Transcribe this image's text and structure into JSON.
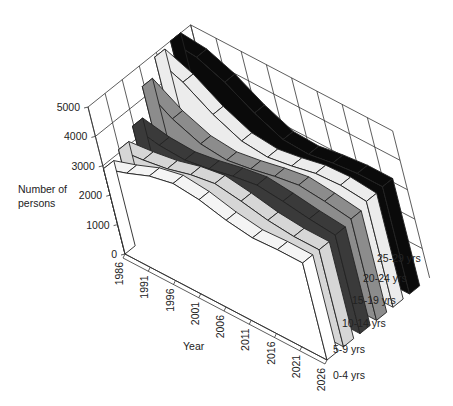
{
  "chart_data": {
    "type": "area",
    "subtype": "3d-ribbon",
    "title": "",
    "xlabel": "Year",
    "ylabel": "Number of persons",
    "zlabel": "",
    "x": [
      1986,
      1991,
      1996,
      2001,
      2006,
      2011,
      2016,
      2021,
      2026
    ],
    "y_ticks": [
      0,
      1000,
      2000,
      3000,
      4000,
      5000
    ],
    "ylim": [
      0,
      5000
    ],
    "grid": true,
    "legend_position": "right (labels at ribbon ends)",
    "series": [
      {
        "name": "0-4 yrs",
        "color": "#ffffff",
        "values": [
          2900,
          3200,
          3550,
          3750,
          3650,
          3400,
          3250,
          3300,
          3300
        ]
      },
      {
        "name": "5-9 yrs",
        "color": "#d6d6d6",
        "values": [
          3100,
          3200,
          3350,
          3600,
          3750,
          3600,
          3400,
          3300,
          3300
        ]
      },
      {
        "name": "10-14 yrs",
        "color": "#3a3a3a",
        "values": [
          3450,
          3250,
          3200,
          3350,
          3550,
          3700,
          3600,
          3450,
          3350
        ]
      },
      {
        "name": "15-19 yrs",
        "color": "#8c8c8c",
        "values": [
          4350,
          3700,
          3300,
          3200,
          3350,
          3550,
          3700,
          3600,
          3450
        ]
      },
      {
        "name": "20-24 yrs",
        "color": "#ececec",
        "values": [
          4900,
          4500,
          3850,
          3400,
          3300,
          3450,
          3650,
          3700,
          3600
        ]
      },
      {
        "name": "25-29 yrs",
        "color": "#0a0a0a",
        "values": [
          5000,
          4900,
          4500,
          3900,
          3450,
          3400,
          3550,
          3650,
          3650
        ]
      }
    ]
  },
  "axes": {
    "ylabel_line1": "Number of",
    "ylabel_line2": "persons",
    "xlabel": "Year"
  }
}
